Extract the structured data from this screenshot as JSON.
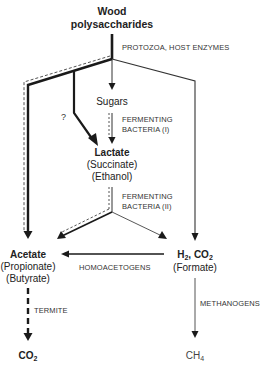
{
  "diagram": {
    "nodes": {
      "wood": {
        "line1": "Wood",
        "line2": "polysaccharides"
      },
      "sugars": {
        "label": "Sugars"
      },
      "lactate": {
        "main": "Lactate",
        "alt1": "(Succinate)",
        "alt2": "(Ethanol)"
      },
      "acetate": {
        "main": "Acetate",
        "alt1": "(Propionate)",
        "alt2": "(Butyrate)"
      },
      "h2co2": {
        "h": "H",
        "h_sub": "2",
        "sep": ", CO",
        "co_sub": "2",
        "alt1": "(Formate)"
      },
      "co2": {
        "main": "CO",
        "sub": "2"
      },
      "ch4": {
        "main": "CH",
        "sub": "4"
      }
    },
    "process_labels": {
      "protozoa": "PROTOZOA, HOST ENZYMES",
      "fermenting1_line1": "FERMENTING",
      "fermenting1_line2": "BACTERIA (I)",
      "fermenting2_line1": "FERMENTING",
      "fermenting2_line2": "BACTERIA (II)",
      "homoacetogens": "HOMOACETOGENS",
      "methanogens": "METHANOGENS",
      "termite": "TERMITE",
      "question": "?"
    },
    "colors": {
      "ink": "#1a1a1a",
      "thin_line": "#444444",
      "dashed_line": "#555555",
      "background": "#ffffff"
    }
  }
}
